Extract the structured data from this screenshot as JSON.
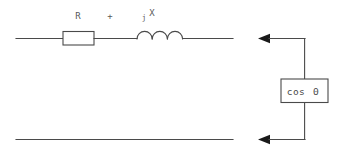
{
  "diagram": {
    "type": "electrical-schematic",
    "colors": {
      "wire": "#4a4a4a",
      "label_text": "#5a5a5a",
      "arrow_fill": "#1a1a1a",
      "background": "#ffffff"
    },
    "labels": {
      "resistor": "R",
      "plus": "+",
      "reactance_j": "j",
      "reactance_x": "X",
      "load_box": "cos",
      "load_box_symbol": "Θ"
    },
    "components": [
      {
        "name": "resistor",
        "label": "R",
        "shape": "rectangle"
      },
      {
        "name": "plus-sign",
        "label": "+",
        "shape": "text"
      },
      {
        "name": "inductor",
        "label": "jX",
        "shape": "coil",
        "turns": 3
      },
      {
        "name": "power-factor-box",
        "label": "cos Θ",
        "shape": "rectangle"
      }
    ],
    "arrows": [
      {
        "name": "top-current-arrow",
        "direction": "left"
      },
      {
        "name": "bottom-current-arrow",
        "direction": "left"
      }
    ]
  }
}
